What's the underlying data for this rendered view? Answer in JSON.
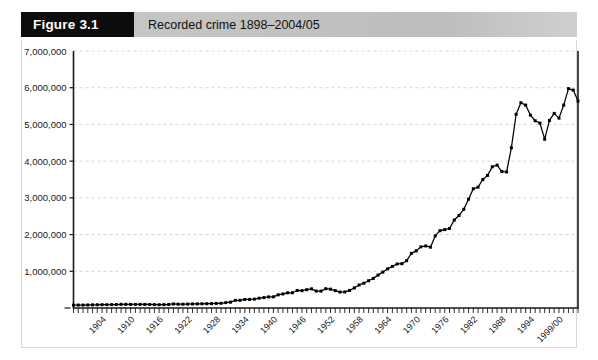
{
  "figure": {
    "tag": "Figure 3.1",
    "caption": "Recorded crime 1898–2004/05"
  },
  "chart_data": {
    "type": "line",
    "title": "Recorded crime 1898–2004/05",
    "xlabel": "",
    "ylabel": "",
    "ylim": [
      0,
      7000000
    ],
    "ytick_step": 1000000,
    "ytick_labels": [
      "7,000,000",
      "6,000,000",
      "5,000,000",
      "4,000,000",
      "3,000,000",
      "2,000,000",
      "1,000,000"
    ],
    "ytick_values": [
      7000000,
      6000000,
      5000000,
      4000000,
      3000000,
      2000000,
      1000000
    ],
    "xtick_labels": [
      "1904",
      "1910",
      "1916",
      "1922",
      "1928",
      "1934",
      "1940",
      "1946",
      "1952",
      "1958",
      "1964",
      "1970",
      "1976",
      "1982",
      "1988",
      "1994",
      "1999/00"
    ],
    "xtick_indices": [
      6,
      12,
      18,
      24,
      30,
      36,
      42,
      48,
      54,
      60,
      66,
      72,
      78,
      84,
      90,
      96,
      102
    ],
    "grid": "horizontal-dashed",
    "legend": "none",
    "marker": "square",
    "line_color": "#000000",
    "grid_color": "#cccccc",
    "axis_color": "#000000",
    "categories": [
      "1898",
      "1899",
      "1900",
      "1901",
      "1902",
      "1903",
      "1904",
      "1905",
      "1906",
      "1907",
      "1908",
      "1909",
      "1910",
      "1911",
      "1912",
      "1913",
      "1914",
      "1915",
      "1916",
      "1917",
      "1918",
      "1919",
      "1920",
      "1921",
      "1922",
      "1923",
      "1924",
      "1925",
      "1926",
      "1927",
      "1928",
      "1929",
      "1930",
      "1931",
      "1932",
      "1933",
      "1934",
      "1935",
      "1936",
      "1937",
      "1938",
      "1939",
      "1940",
      "1941",
      "1942",
      "1943",
      "1944",
      "1945",
      "1946",
      "1947",
      "1948",
      "1949",
      "1950",
      "1951",
      "1952",
      "1953",
      "1954",
      "1955",
      "1956",
      "1957",
      "1958",
      "1959",
      "1960",
      "1961",
      "1962",
      "1963",
      "1964",
      "1965",
      "1966",
      "1967",
      "1968",
      "1969",
      "1970",
      "1971",
      "1972",
      "1973",
      "1974",
      "1975",
      "1976",
      "1977",
      "1978",
      "1979",
      "1980",
      "1981",
      "1982",
      "1983",
      "1984",
      "1985",
      "1986",
      "1987",
      "1988",
      "1989",
      "1990",
      "1991",
      "1992",
      "1993",
      "1994",
      "1995",
      "1996",
      "1997",
      "1998/99",
      "1999/00",
      "2000/01",
      "2001/02",
      "2002/03",
      "2003/04",
      "2004/05"
    ],
    "values": [
      78000,
      80000,
      80000,
      82000,
      85000,
      88000,
      90000,
      90000,
      92000,
      95000,
      100000,
      100000,
      98000,
      97000,
      98000,
      98000,
      96000,
      92000,
      90000,
      92000,
      96000,
      110000,
      104000,
      103000,
      106000,
      110000,
      112000,
      114000,
      117000,
      120000,
      125000,
      128000,
      147000,
      159000,
      208000,
      209000,
      233000,
      234000,
      241000,
      266000,
      283000,
      303000,
      305000,
      359000,
      383000,
      414000,
      415000,
      478000,
      472000,
      498000,
      522000,
      461000,
      461000,
      525000,
      513000,
      473000,
      435000,
      438000,
      479000,
      546000,
      626000,
      676000,
      743000,
      807000,
      896000,
      978000,
      1067000,
      1134000,
      1199000,
      1207000,
      1289000,
      1488000,
      1556000,
      1666000,
      1690000,
      1657000,
      1963000,
      2106000,
      2136000,
      2166000,
      2395000,
      2520000,
      2688000,
      2963000,
      3247000,
      3291000,
      3499000,
      3612000,
      3847000,
      3892000,
      3716000,
      3706000,
      4364000,
      5276000,
      5592000,
      5527000,
      5253000,
      5100000,
      5036000,
      4598000,
      5109000,
      5301000,
      5171000,
      5527000,
      5975000,
      5935000,
      5637000
    ]
  }
}
